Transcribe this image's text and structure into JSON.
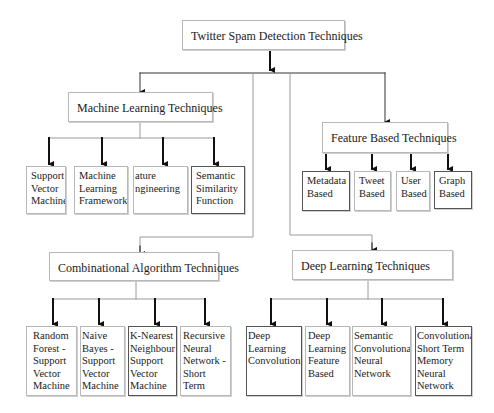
{
  "title": "Twitter Spam Detection Techniques",
  "categories": {
    "machine_learning": {
      "label": "Machine Learning Techniques",
      "children": [
        "Support\nVector\nMachine",
        "Machine\nLearning\nFramework",
        "ature\nngineering",
        "Semantic\nSimilarity\nFunction"
      ]
    },
    "feature_based": {
      "label": "Feature Based Techniques",
      "children": [
        "Metadata\nBased",
        "Tweet\nBased",
        "User\nBased",
        "Graph\nBased"
      ]
    },
    "combinational": {
      "label": "Combinational Algorithm Techniques",
      "children": [
        "Random\nForest -\nSupport\nVector\nMachine",
        "Naive\nBayes -\nSupport\nVector\nMachine",
        "K-Nearest\nNeighbour\nSupport\nVector\nMachine",
        "Recursive\nNeural\nNetwork -\nShort Term\nMemory"
      ]
    },
    "deep_learning": {
      "label": "Deep Learning Techniques",
      "children": [
        "Deep\nLearning\nConvolutional",
        "Deep\nLearning\nFeature\nBased",
        "Semantic\nConvolutional\nNeural\nNetwork",
        "Convolutional\nShort Term\nMemory\nNeural\nNetwork"
      ]
    }
  },
  "colors": {
    "line": "#111111",
    "thin_line": "#9a9a9a",
    "box_border": "#b8b8b8"
  }
}
